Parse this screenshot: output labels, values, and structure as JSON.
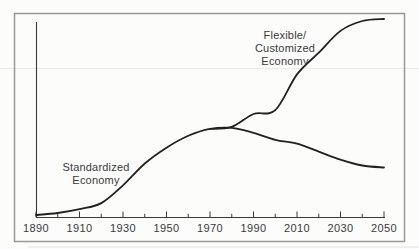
{
  "figure": {
    "background": "#fcfcfb",
    "frame_color": "#98999c",
    "axis_color": "#39393b",
    "curve_color": "#212121",
    "text_color": "#3a3a3b"
  },
  "chart_data": {
    "type": "line",
    "title": "",
    "xlabel": "",
    "ylabel": "",
    "xlim": [
      1890,
      2050
    ],
    "ylim": [
      0,
      100
    ],
    "grid": false,
    "y_axis_labeled": false,
    "legend": "inline-annotations",
    "x_tick_years": [
      1890,
      1910,
      1930,
      1950,
      1970,
      1990,
      2010,
      2030,
      2050
    ],
    "x_tick_labels": [
      "1890",
      "1910",
      "1930",
      "1950",
      "1970",
      "1990",
      "2010",
      "2030",
      "2050"
    ],
    "x_minor_tick_years": [
      1900,
      1920,
      1940,
      1960,
      1980,
      2000,
      2020,
      2040
    ],
    "series": [
      {
        "name": "Standardized Economy",
        "x": [
          1890,
          1900,
          1910,
          1920,
          1930,
          1940,
          1950,
          1960,
          1970,
          1980,
          1990,
          2000,
          2010,
          2020,
          2030,
          2040,
          2050
        ],
        "values": [
          1,
          2,
          4,
          7,
          16,
          27,
          35,
          41,
          44.5,
          45,
          42.5,
          39,
          37,
          33,
          29,
          26,
          25
        ]
      },
      {
        "name": "Flexible/Customized Economy",
        "x": [
          1970,
          1980,
          1990,
          2000,
          2010,
          2020,
          2030,
          2040,
          2050
        ],
        "values": [
          44.5,
          45.5,
          52,
          54,
          72,
          83,
          94,
          99,
          100
        ]
      }
    ],
    "annotations": [
      {
        "series": "Standardized Economy",
        "lines": [
          "Standardized",
          "Economy"
        ]
      },
      {
        "series": "Flexible/Customized Economy",
        "lines": [
          "Flexible/",
          "Customized",
          "Economy"
        ]
      }
    ]
  }
}
